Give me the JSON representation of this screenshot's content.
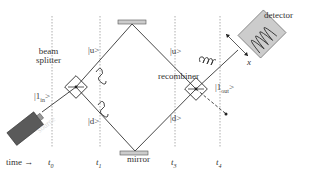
{
  "diagram": {
    "components": {
      "source": "source",
      "beam_splitter": [
        "beam",
        "splitter"
      ],
      "recombiner": "recombiner",
      "mirror": "mirror",
      "detector": "detector"
    },
    "states": {
      "input": "|1in>",
      "upper": "|u>",
      "lower": "|d>",
      "output": "|1out>",
      "input_base": "|1",
      "input_sub": "in",
      "output_base": "|1",
      "output_sub": "out"
    },
    "axis": {
      "label": "time",
      "arrow": "→",
      "ticks": [
        {
          "base": "t",
          "sub": "0"
        },
        {
          "base": "t",
          "sub": "1"
        },
        {
          "base": "t",
          "sub": "3"
        },
        {
          "base": "t",
          "sub": "4"
        }
      ]
    },
    "detector_axis_label": "x",
    "colors": {
      "line": "#333333",
      "source_fill": "#555555",
      "detector_fill": "#cccccc",
      "mirror_fill": "#cccccc",
      "dotted": "#888888"
    }
  }
}
